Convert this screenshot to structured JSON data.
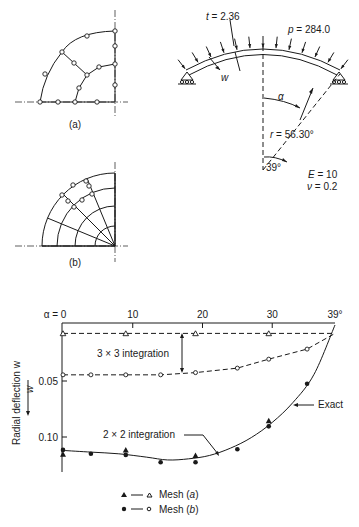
{
  "figure": {
    "mesh_a_caption": "(a)",
    "mesh_b_caption": "(b)",
    "shell": {
      "thickness_label": "t = 2.36",
      "pressure_label": "p = 284.0",
      "deflection_label": "w",
      "angle_label": "α",
      "radius_label": "r = 56.30°",
      "half_angle_label": "39°",
      "E_label": "E = 10",
      "nu_label": "ν = 0.2"
    }
  },
  "chart_data": {
    "type": "line",
    "title": "",
    "xlabel": "α",
    "ylabel": "Radial deflection w",
    "x_axis_position": "top",
    "y_inverted": true,
    "xlim": [
      0,
      39
    ],
    "ylim": [
      0,
      0.12
    ],
    "x_ticks": [
      {
        "value": 0,
        "label": "α = 0"
      },
      {
        "value": 10,
        "label": "10"
      },
      {
        "value": 20,
        "label": "20"
      },
      {
        "value": 30,
        "label": "30"
      },
      {
        "value": 39,
        "label": "39°"
      }
    ],
    "y_ticks": [
      {
        "value": 0.05,
        "label": "0.05"
      },
      {
        "value": 0.1,
        "label": "0.10"
      }
    ],
    "y_arrow_label": "w",
    "series": [
      {
        "name": "Exact",
        "style": "solid",
        "x": [
          0,
          4,
          8,
          12,
          15,
          18,
          21,
          24,
          27,
          30,
          33,
          36,
          39
        ],
        "y": [
          0.112,
          0.1135,
          0.115,
          0.118,
          0.1205,
          0.1195,
          0.1165,
          0.11,
          0.1005,
          0.087,
          0.069,
          0.044,
          0.0
        ]
      },
      {
        "name": "Mesh (a) 2×2 integration",
        "marker": "filled-triangle",
        "x": [
          0,
          9,
          19,
          29.5
        ],
        "y": [
          0.1155,
          0.1115,
          0.1165,
          0.0855
        ]
      },
      {
        "name": "Mesh (b) 2×2 integration",
        "marker": "filled-circle",
        "x": [
          0,
          4,
          9,
          14,
          19,
          25,
          29.5,
          35
        ],
        "y": [
          0.1115,
          0.115,
          0.116,
          0.1225,
          0.1225,
          0.111,
          0.0905,
          0.0525
        ]
      },
      {
        "name": "Mesh (a) 3×3 integration",
        "marker": "open-triangle",
        "style": "dashed",
        "x": [
          0,
          9,
          19,
          29.5,
          39
        ],
        "y": [
          0.0075,
          0.0075,
          0.0075,
          0.0075,
          0.0075
        ]
      },
      {
        "name": "Mesh (b) 3×3 integration",
        "marker": "open-circle",
        "style": "dashed",
        "x": [
          0,
          4,
          9,
          14,
          19,
          25,
          29.5,
          35,
          39
        ],
        "y": [
          0.0445,
          0.0445,
          0.0445,
          0.0445,
          0.0425,
          0.0385,
          0.0305,
          0.0215,
          0.0075
        ]
      }
    ],
    "annotations": [
      {
        "text": "3 × 3 integration"
      },
      {
        "text": "2 × 2 integration"
      },
      {
        "text": "Exact"
      }
    ],
    "legend": {
      "placement": "bottom-center",
      "entries": [
        {
          "label": "Mesh (a)",
          "markers": [
            "filled-triangle",
            "open-triangle"
          ]
        },
        {
          "label": "Mesh (b)",
          "markers": [
            "filled-circle",
            "open-circle"
          ]
        }
      ]
    }
  }
}
